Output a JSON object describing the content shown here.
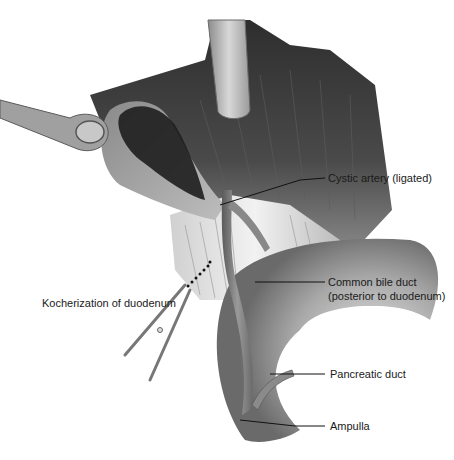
{
  "figure": {
    "labels": {
      "cystic_artery": "Cystic artery (ligated)",
      "common_bile_duct_line1": "Common bile duct",
      "common_bile_duct_line2": "(posterior to duodenum)",
      "kocherization": "Kocherization of duodenum",
      "pancreatic_duct": "Pancreatic duct",
      "ampulla": "Ampulla"
    },
    "colors": {
      "background": "#ffffff",
      "liver_dark": "#3c3c3c",
      "liver_mid": "#6a6a6a",
      "retractor": "#b8b8b8",
      "duodenum": "#9a9a9a",
      "duct": "#7e7e7e",
      "leader_line": "#111111"
    }
  }
}
